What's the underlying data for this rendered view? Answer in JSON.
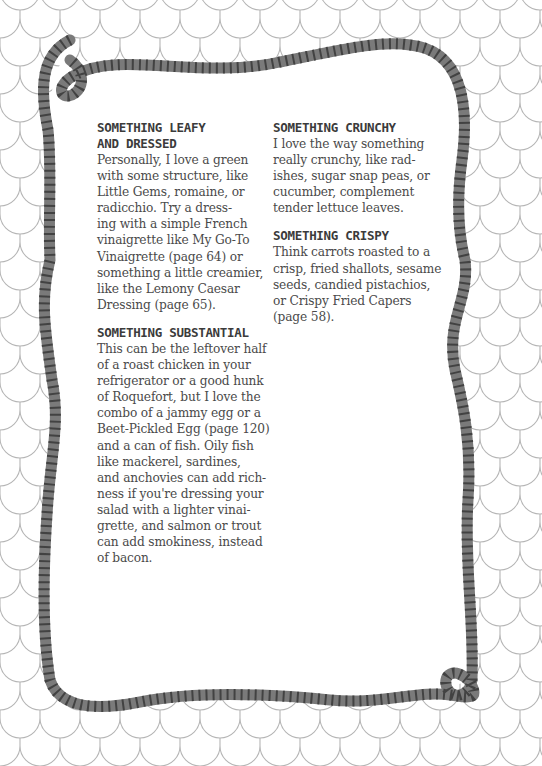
{
  "page": {
    "colors": {
      "background": "#ffffff",
      "scale_lines": "#b5b5b5",
      "rope": "#7a7a7a",
      "rope_stripe": "#3c3c3c",
      "text": "#4a4a4a",
      "heading": "#3b3b3b"
    },
    "left_column": {
      "sections": [
        {
          "heading": "SOMETHING LEAFY\nAND DRESSED",
          "body": "Personally, I love a green\nwith some structure, like\nLittle Gems, romaine, or\nradicchio. Try a dress-\ning with a simple French\nvinaigrette like My Go-To\nVinaigrette (page 64) or\nsomething a little creamier,\nlike the Lemony Caesar\nDressing (page 65)."
        },
        {
          "heading": "SOMETHING SUBSTANTIAL",
          "body": "This can be the leftover half\nof a roast chicken in your\nrefrigerator or a good hunk\nof Roquefort, but I love the\ncombo of a jammy egg or a\nBeet-Pickled Egg (page 120)\nand a can of fish. Oily fish\nlike mackerel, sardines,\nand anchovies can add rich-\nness if you're dressing your\nsalad with a lighter vinai-\ngrette, and salmon or trout\ncan add smokiness, instead\nof bacon."
        }
      ]
    },
    "right_column": {
      "sections": [
        {
          "heading": "SOMETHING CRUNCHY",
          "body": "I love the way something\nreally crunchy, like rad-\nishes, sugar snap peas, or\ncucumber, complement\ntender lettuce leaves."
        },
        {
          "heading": "SOMETHING CRISPY",
          "body": "Think carrots roasted to a\ncrisp, fried shallots, sesame\nseeds, candied pistachios,\nor Crispy Fried Capers\n(page 58)."
        }
      ]
    }
  }
}
